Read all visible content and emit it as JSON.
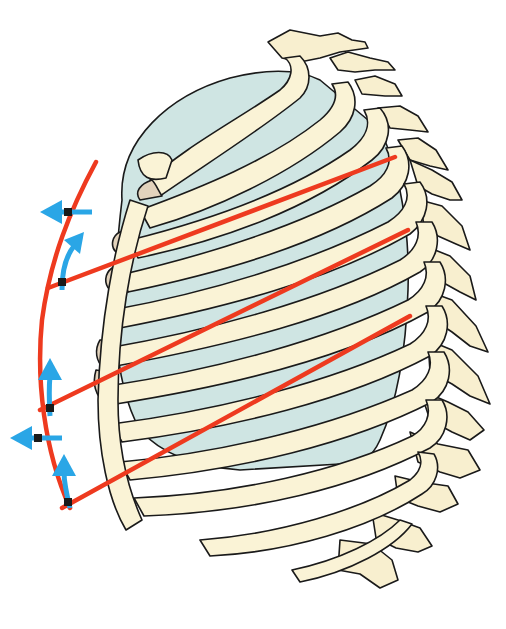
{
  "diagram": {
    "title": "",
    "colors": {
      "background": "#ffffff",
      "bone": "#faf3d6",
      "costal_cartilage": "#e3d3bc",
      "lung": "#cfe5e3",
      "outline": "#1a1a1a",
      "rib_axis_lines": "#ee3a1f",
      "motion_arrows": "#2aa6e6"
    },
    "elements": {
      "spine": {
        "label": "thoracic-spine",
        "visible_text": ""
      },
      "ribs": {
        "label": "rib-cage",
        "count_visible": 12,
        "visible_text": ""
      },
      "lungs": {
        "label": "lung",
        "visible_text": ""
      },
      "sternum": {
        "label": "sternum",
        "visible_text": ""
      },
      "red_lines": {
        "label": "rib-lever-axes",
        "count": 3,
        "description": "Three straight red lines from vertebral column to anterior arc, joined by a curved red arc on the anterior side"
      },
      "blue_arrows": {
        "label": "motion-arrows",
        "count": 5,
        "horizontal_left": 2,
        "curved_up": 3
      }
    }
  }
}
